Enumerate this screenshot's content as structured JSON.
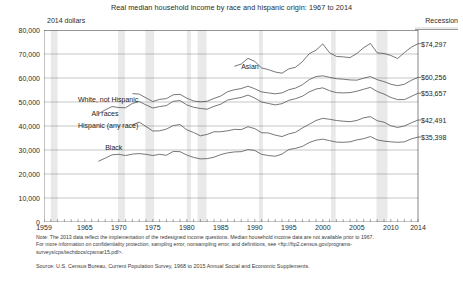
{
  "header": {
    "title": "Real median household income by race and hispanic origin: 1967 to 2014",
    "units_label": "2014 dollars",
    "recession_label": "Recession"
  },
  "notes": {
    "line1": "Note: The 2013 data reflect the implementation of the redesigned income questions. Median household income data are not available prior to 1967.",
    "line2": "For more information on confidentiality protection, sampling error, nonsampling error, and definitions, see <ftp://ftp2.census.gov/programs-",
    "line3": "surveys/cps/techdocs/cpsmar15.pdf>.",
    "source": "Source: U.S. Census Bureau, Current Population Survey, 1968 to 2015 Annual Social and Economic Supplements."
  },
  "chart_data": {
    "type": "line",
    "title": "Real median household income by race and hispanic origin: 1967 to 2014",
    "xlabel": "",
    "ylabel": "2014 dollars",
    "xlim": [
      1959,
      2014
    ],
    "ylim": [
      0,
      80000
    ],
    "grid": true,
    "legend_position": "inline-labels",
    "x_ticks": [
      1959,
      1965,
      1970,
      1975,
      1980,
      1985,
      1990,
      1995,
      2000,
      2005,
      2010,
      2014
    ],
    "y_ticks": [
      0,
      10000,
      20000,
      30000,
      40000,
      50000,
      60000,
      70000,
      80000
    ],
    "y_tick_labels": [
      "0",
      "10,000",
      "20,000",
      "30,000",
      "40,000",
      "50,000",
      "60,000",
      "70,000",
      "80,000"
    ],
    "end_value_labels": [
      {
        "series": "Asian",
        "value": 74297,
        "text": "$74,297"
      },
      {
        "series": "White, not Hispanic",
        "value": 60256,
        "text": "$60,256"
      },
      {
        "series": "All races",
        "value": 53657,
        "text": "$53,657"
      },
      {
        "series": "Hispanic (any race)",
        "value": 42491,
        "text": "$42,491"
      },
      {
        "series": "Black",
        "value": 35398,
        "text": "$35,398"
      }
    ],
    "inline_labels": [
      {
        "text": "Asian",
        "x": 1988,
        "y": 64500
      },
      {
        "text": "White, not Hispanic",
        "x": 1964,
        "y": 51000
      },
      {
        "text": "All races",
        "x": 1966,
        "y": 44800
      },
      {
        "text": "Hispanic (any race)",
        "x": 1964,
        "y": 40200
      },
      {
        "text": "Black",
        "x": 1968,
        "y": 31000
      }
    ],
    "recession_bands": [
      [
        1960,
        1961
      ],
      [
        1969.9,
        1970.9
      ],
      [
        1973.9,
        1975.2
      ],
      [
        1980,
        1980.6
      ],
      [
        1981.6,
        1982.9
      ],
      [
        1990.6,
        1991.2
      ],
      [
        2001.2,
        2001.9
      ],
      [
        2007.9,
        2009.5
      ]
    ],
    "series": [
      {
        "name": "Asian",
        "x": [
          1987,
          1988,
          1989,
          1990,
          1991,
          1992,
          1993,
          1994,
          1995,
          1996,
          1997,
          1998,
          1999,
          2000,
          2001,
          2002,
          2003,
          2004,
          2005,
          2006,
          2007,
          2008,
          2009,
          2010,
          2011,
          2012,
          2013,
          2014
        ],
        "values": [
          64900,
          65800,
          68200,
          66900,
          64200,
          63500,
          62500,
          62000,
          63800,
          64500,
          66800,
          70100,
          71600,
          74200,
          70500,
          69000,
          68800,
          68500,
          70200,
          72600,
          74400,
          70500,
          70200,
          69400,
          68100,
          70600,
          72800,
          74297
        ]
      },
      {
        "name": "White, not Hispanic",
        "x": [
          1972,
          1973,
          1974,
          1975,
          1976,
          1977,
          1978,
          1979,
          1980,
          1981,
          1982,
          1983,
          1984,
          1985,
          1986,
          1987,
          1988,
          1989,
          1990,
          1991,
          1992,
          1993,
          1994,
          1995,
          1996,
          1997,
          1998,
          1999,
          2000,
          2001,
          2002,
          2003,
          2004,
          2005,
          2006,
          2007,
          2008,
          2009,
          2010,
          2011,
          2012,
          2013,
          2014
        ],
        "values": [
          53500,
          53300,
          51700,
          50200,
          51100,
          51400,
          53000,
          53200,
          51600,
          50400,
          50100,
          50300,
          51500,
          52500,
          54300,
          55100,
          55600,
          56600,
          55500,
          54200,
          53800,
          53400,
          53800,
          55100,
          55800,
          57200,
          59300,
          60600,
          60900,
          60300,
          59700,
          59500,
          59200,
          59100,
          59900,
          60600,
          59300,
          58500,
          57400,
          56800,
          57400,
          59000,
          60256
        ]
      },
      {
        "name": "All races",
        "x": [
          1967,
          1968,
          1969,
          1970,
          1971,
          1972,
          1973,
          1974,
          1975,
          1976,
          1977,
          1978,
          1979,
          1980,
          1981,
          1982,
          1983,
          1984,
          1985,
          1986,
          1987,
          1988,
          1989,
          1990,
          1991,
          1992,
          1993,
          1994,
          1995,
          1996,
          1997,
          1998,
          1999,
          2000,
          2001,
          2002,
          2003,
          2004,
          2005,
          2006,
          2007,
          2008,
          2009,
          2010,
          2011,
          2012,
          2013,
          2014
        ],
        "values": [
          45100,
          46700,
          48100,
          47700,
          47600,
          49400,
          50200,
          48800,
          47500,
          48100,
          48500,
          50300,
          50600,
          48800,
          47800,
          47300,
          47000,
          48200,
          49100,
          50800,
          51400,
          51900,
          52900,
          51600,
          50000,
          49400,
          48800,
          49300,
          50700,
          51400,
          52400,
          54200,
          55400,
          55900,
          54700,
          53900,
          53800,
          53900,
          54500,
          55300,
          56100,
          54400,
          53300,
          51900,
          51000,
          51000,
          52300,
          53657
        ]
      },
      {
        "name": "Hispanic (any race)",
        "x": [
          1972,
          1973,
          1974,
          1975,
          1976,
          1977,
          1978,
          1979,
          1980,
          1981,
          1982,
          1983,
          1984,
          1985,
          1986,
          1987,
          1988,
          1989,
          1990,
          1991,
          1992,
          1993,
          1994,
          1995,
          1996,
          1997,
          1998,
          1999,
          2000,
          2001,
          2002,
          2003,
          2004,
          2005,
          2006,
          2007,
          2008,
          2009,
          2010,
          2011,
          2012,
          2013,
          2014
        ],
        "values": [
          40500,
          41600,
          39800,
          37900,
          38000,
          38700,
          40200,
          40600,
          38400,
          37300,
          35900,
          36500,
          37600,
          37600,
          38000,
          38600,
          38500,
          39700,
          38900,
          37200,
          37100,
          36200,
          35600,
          36700,
          37400,
          39200,
          40700,
          42300,
          43200,
          42800,
          42300,
          42000,
          41800,
          42300,
          43400,
          43900,
          42200,
          41600,
          40100,
          39400,
          40000,
          41300,
          42491
        ]
      },
      {
        "name": "Black",
        "x": [
          1967,
          1968,
          1969,
          1970,
          1971,
          1972,
          1973,
          1974,
          1975,
          1976,
          1977,
          1978,
          1979,
          1980,
          1981,
          1982,
          1983,
          1984,
          1985,
          1986,
          1987,
          1988,
          1989,
          1990,
          1991,
          1992,
          1993,
          1994,
          1995,
          1996,
          1997,
          1998,
          1999,
          2000,
          2001,
          2002,
          2003,
          2004,
          2005,
          2006,
          2007,
          2008,
          2009,
          2010,
          2011,
          2012,
          2013,
          2014
        ],
        "values": [
          25300,
          26600,
          28000,
          28200,
          27700,
          28300,
          28500,
          28200,
          27700,
          28200,
          27800,
          29400,
          29300,
          27900,
          26900,
          26300,
          26400,
          27000,
          28100,
          28800,
          29200,
          29300,
          30200,
          29800,
          28200,
          27700,
          27400,
          28300,
          30200,
          30700,
          31500,
          33100,
          34100,
          34500,
          33900,
          33300,
          33200,
          33400,
          34200,
          34700,
          35600,
          34200,
          33700,
          33400,
          33200,
          33400,
          34600,
          35398
        ]
      }
    ]
  }
}
